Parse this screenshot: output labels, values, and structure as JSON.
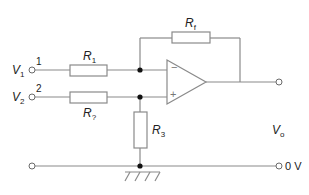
{
  "diagram": {
    "type": "op-amp differential amplifier circuit",
    "colors": {
      "wire": "#8a8a8a",
      "text": "#222222",
      "node": "#111111"
    },
    "inputs": [
      {
        "name": "V",
        "sub": "1",
        "terminal": "1"
      },
      {
        "name": "V",
        "sub": "2",
        "terminal": "2"
      }
    ],
    "resistors": {
      "r1": {
        "name": "R",
        "sub": "1"
      },
      "r2": {
        "name": "R",
        "sub": "?"
      },
      "r3": {
        "name": "R",
        "sub": "3"
      },
      "rf": {
        "name": "R",
        "sub": "f"
      }
    },
    "opamp": {
      "inverting": "−",
      "noninverting": "+"
    },
    "output": {
      "name": "V",
      "sub": "o"
    },
    "ground_label": "0 V"
  }
}
